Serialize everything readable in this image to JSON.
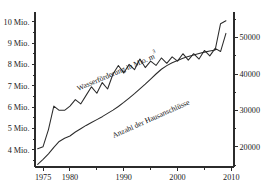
{
  "chart_data": {
    "type": "line",
    "title": "",
    "subtitle": "",
    "xlabel": "",
    "ylabel": "",
    "grid": false,
    "legend_position": "inline-annotations",
    "x": [
      1974,
      1975,
      1976,
      1977,
      1978,
      1979,
      1980,
      1981,
      1982,
      1983,
      1984,
      1985,
      1986,
      1987,
      1988,
      1989,
      1990,
      1991,
      1992,
      1993,
      1994,
      1995,
      1996,
      1997,
      1998,
      1999,
      2000,
      2001,
      2002,
      2003,
      2004,
      2005,
      2006,
      2007,
      2008,
      2009
    ],
    "xlim": [
      1973.5,
      2010.5
    ],
    "x_ticks_major": [
      1975,
      1980,
      1990,
      2000,
      2010
    ],
    "x_tick_labels": [
      "1975",
      "1980",
      "1990",
      "2000",
      "2010"
    ],
    "x_ticks_minor": [
      1985,
      1995,
      2005
    ],
    "axes": [
      {
        "id": "left",
        "name": "Wasserförderung",
        "unit": "Mio. m³",
        "ticks": [
          4,
          5,
          6,
          7,
          8,
          9,
          10
        ],
        "tick_labels": [
          "4 Mio.",
          "5 Mio.",
          "6 Mio.",
          "7 Mio.",
          "8 Mio.",
          "9 Mio.",
          "10 Mio."
        ],
        "ylim": [
          3.2,
          10.45
        ]
      },
      {
        "id": "right",
        "name": "Anzahl der Hausanschlüsse",
        "unit": "",
        "ticks": [
          20000,
          30000,
          40000,
          50000
        ],
        "tick_labels": [
          "20000",
          "30000",
          "40000",
          "50000"
        ],
        "ticks_minor": [
          15000,
          25000,
          35000,
          45000,
          55000
        ],
        "ylim": [
          14500,
          57000
        ]
      }
    ],
    "series": [
      {
        "name": "Wasserförderung in Mio. m³",
        "axis": "left",
        "label_text": "Wasserförderung in Mio. m",
        "label_superscript": "3",
        "label_x": 118,
        "label_y": 74,
        "label_rotation": -23,
        "color": "#2b2b2b",
        "values": [
          4.05,
          4.15,
          4.95,
          6.05,
          5.85,
          5.85,
          6.05,
          6.35,
          6.15,
          6.55,
          6.95,
          6.65,
          7.15,
          6.85,
          7.55,
          7.95,
          7.6,
          8.0,
          7.75,
          8.25,
          7.85,
          8.15,
          7.95,
          8.3,
          8.05,
          8.35,
          8.15,
          8.5,
          8.2,
          8.5,
          8.25,
          8.65,
          8.4,
          8.75,
          8.6,
          9.45
        ]
      },
      {
        "name": "Anzahl der Hausanschlüsse",
        "axis": "right",
        "label_text": "Anzahl der Hausanschlüsse",
        "label_superscript": "",
        "label_x": 152,
        "label_y": 121,
        "label_rotation": -24,
        "color": "#2b2b2b",
        "values": [
          15200,
          16600,
          18100,
          19900,
          21500,
          22400,
          23000,
          24100,
          25000,
          25900,
          26700,
          27500,
          28300,
          29200,
          30100,
          31100,
          32200,
          33400,
          34600,
          35900,
          37200,
          38600,
          40000,
          41300,
          42300,
          43100,
          43700,
          44300,
          44800,
          45200,
          45600,
          46000,
          46300,
          46600,
          53800,
          54600
        ]
      }
    ],
    "annotations": [
      {
        "name": "step-jump",
        "description": "Sprung in der Anzahl der Hausanschlüsse zwischen 2007 und 2008",
        "year": 2007
      }
    ]
  },
  "plot_geometry": {
    "left_px": 35,
    "right_px": 234,
    "top_px": 12,
    "bottom_px": 167
  }
}
